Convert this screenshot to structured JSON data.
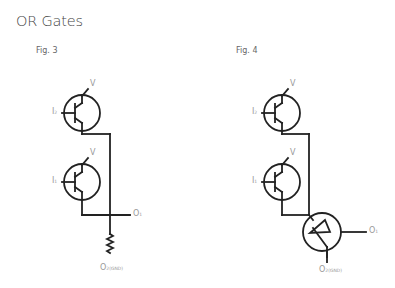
{
  "title": "OR Gates",
  "figures": [
    {
      "caption": "Fig. 3",
      "labels": {
        "v_top": "V",
        "v_bottom": "V",
        "input_2": "I",
        "input_2_sub": "2",
        "input_1": "I",
        "input_1_sub": "1",
        "output_1": "O",
        "output_1_sub": "1",
        "output_2": "O",
        "output_2_sub": "2(GND)"
      }
    },
    {
      "caption": "Fig. 4",
      "labels": {
        "v_top": "V",
        "v_bottom": "V",
        "input_2": "I",
        "input_2_sub": "2",
        "input_1": "I",
        "input_1_sub": "1",
        "output_1": "O",
        "output_1_sub": "1",
        "output_2": "O",
        "output_2_sub": "2(GND)"
      }
    }
  ],
  "colors": {
    "line": "#222222",
    "label": "#999999",
    "title": "#444444"
  }
}
